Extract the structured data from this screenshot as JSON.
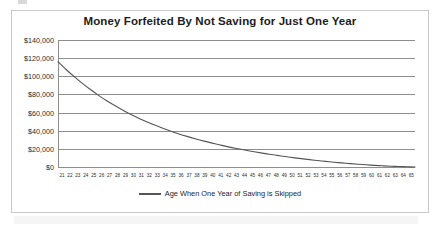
{
  "chart_data": {
    "type": "line",
    "title": "Money Forfeited By Not Saving for Just One Year",
    "xlabel": "",
    "ylabel": "",
    "xlim": [
      21,
      65
    ],
    "ylim": [
      0,
      140000
    ],
    "grid": true,
    "legend_position": "bottom",
    "ytick_labels": [
      "$140,000",
      "$120,000",
      "$100,000",
      "$80,000",
      "$60,000",
      "$40,000",
      "$20,000",
      "$0"
    ],
    "ytick_values": [
      140000,
      120000,
      100000,
      80000,
      60000,
      40000,
      20000,
      0
    ],
    "categories": [
      21,
      22,
      23,
      24,
      25,
      26,
      27,
      28,
      29,
      30,
      31,
      32,
      33,
      34,
      35,
      36,
      37,
      38,
      39,
      40,
      41,
      42,
      43,
      44,
      45,
      46,
      47,
      48,
      49,
      50,
      51,
      52,
      53,
      54,
      55,
      56,
      57,
      58,
      59,
      60,
      61,
      62,
      63,
      64,
      65
    ],
    "series": [
      {
        "name": "Age When One Year of Saving is Skipped",
        "color": "#555555",
        "values": [
          116000,
          107500,
          99600,
          92200,
          85400,
          79000,
          73100,
          67700,
          62600,
          57900,
          53600,
          49600,
          45900,
          42400,
          39200,
          36200,
          33500,
          30900,
          28500,
          26300,
          24200,
          22200,
          20400,
          18700,
          17100,
          15600,
          14100,
          12800,
          11500,
          10300,
          9200,
          8100,
          7100,
          6200,
          5300,
          4500,
          3700,
          3000,
          2400,
          1800,
          1300,
          900,
          550,
          250,
          0
        ]
      }
    ]
  },
  "legend": {
    "label": "Age When One Year of Saving is Skipped"
  }
}
